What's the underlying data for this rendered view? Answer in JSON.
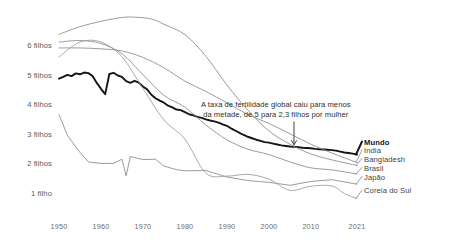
{
  "chart_data": {
    "type": "line",
    "title": "",
    "xlabel": "",
    "ylabel": "",
    "xlim": [
      1950,
      2021
    ],
    "ylim": [
      0.6,
      7.4
    ],
    "grid": false,
    "legend_position": "right-inline",
    "ytick_labels": [
      "6 filhos",
      "5 filhos",
      "4 filhos",
      "3 filhos",
      "2 filhos",
      "1 filho"
    ],
    "ytick_values": [
      6,
      5,
      4,
      3,
      2,
      1
    ],
    "xtick_labels": [
      "1950",
      "1960",
      "1970",
      "1980",
      "1990",
      "2000",
      "2010",
      "2021"
    ],
    "xtick_values": [
      1950,
      1960,
      1970,
      1980,
      1990,
      2000,
      2010,
      2021
    ],
    "annotations": [
      {
        "name": "global-fertility-note",
        "lines": [
          "A taxa de fertilidade global caiu para menos",
          "da metade, de 5 para 2,3 filhos por mulher"
        ],
        "arrow_points_to": {
          "x": 2006,
          "y": 2.6
        }
      }
    ],
    "series": [
      {
        "name": "Mundo",
        "label": "Mundo",
        "color": "#151515",
        "width": 1.9,
        "emphasis": true,
        "x": [
          1950,
          1951,
          1952,
          1953,
          1954,
          1955,
          1956,
          1957,
          1958,
          1959,
          1960,
          1961,
          1962,
          1963,
          1964,
          1965,
          1966,
          1967,
          1968,
          1969,
          1970,
          1971,
          1972,
          1973,
          1974,
          1975,
          1976,
          1977,
          1978,
          1979,
          1980,
          1981,
          1982,
          1983,
          1984,
          1985,
          1986,
          1987,
          1988,
          1989,
          1990,
          1991,
          1992,
          1993,
          1994,
          1995,
          1996,
          1997,
          1998,
          1999,
          2000,
          2001,
          2002,
          2003,
          2004,
          2005,
          2006,
          2007,
          2008,
          2009,
          2010,
          2011,
          2012,
          2013,
          2014,
          2015,
          2016,
          2017,
          2018,
          2019,
          2020,
          2021
        ],
        "y": [
          4.86,
          4.92,
          4.99,
          4.95,
          5.04,
          5.01,
          5.07,
          5.05,
          4.95,
          4.72,
          4.52,
          4.34,
          5.02,
          5.06,
          4.97,
          4.92,
          4.78,
          4.72,
          4.79,
          4.73,
          4.6,
          4.5,
          4.32,
          4.2,
          4.12,
          4.05,
          3.95,
          3.89,
          3.82,
          3.8,
          3.73,
          3.66,
          3.62,
          3.57,
          3.54,
          3.49,
          3.45,
          3.42,
          3.38,
          3.32,
          3.27,
          3.18,
          3.11,
          3.03,
          2.96,
          2.9,
          2.85,
          2.8,
          2.76,
          2.72,
          2.7,
          2.67,
          2.64,
          2.61,
          2.59,
          2.57,
          2.56,
          2.55,
          2.53,
          2.52,
          2.51,
          2.49,
          2.48,
          2.47,
          2.46,
          2.45,
          2.43,
          2.4,
          2.37,
          2.35,
          2.33,
          2.3
        ]
      },
      {
        "name": "India",
        "label": "India",
        "color": "#8a8a8a",
        "width": 0.85,
        "emphasis": false,
        "x": [
          1950,
          1955,
          1960,
          1965,
          1970,
          1975,
          1980,
          1985,
          1990,
          1995,
          2000,
          2005,
          2010,
          2015,
          2021
        ],
        "y": [
          5.9,
          5.9,
          5.87,
          5.8,
          5.58,
          5.23,
          4.78,
          4.43,
          4.05,
          3.65,
          3.35,
          3.0,
          2.65,
          2.35,
          2.03
        ]
      },
      {
        "name": "Bangladesh",
        "label": "Bangladesh",
        "color": "#8a8a8a",
        "width": 0.85,
        "emphasis": false,
        "x": [
          1950,
          1955,
          1960,
          1965,
          1968,
          1972,
          1975,
          1980,
          1985,
          1990,
          1995,
          2000,
          2005,
          2010,
          2015,
          2021
        ],
        "y": [
          6.36,
          6.62,
          6.8,
          6.93,
          6.94,
          6.88,
          6.7,
          6.35,
          5.62,
          4.65,
          3.8,
          3.1,
          2.65,
          2.32,
          2.12,
          1.93
        ]
      },
      {
        "name": "Brasil",
        "label": "Brasil",
        "color": "#8a8a8a",
        "width": 0.85,
        "emphasis": false,
        "x": [
          1950,
          1955,
          1960,
          1965,
          1970,
          1975,
          1980,
          1985,
          1990,
          1995,
          2000,
          2005,
          2010,
          2015,
          2021
        ],
        "y": [
          6.1,
          6.15,
          6.05,
          5.7,
          5.0,
          4.3,
          3.9,
          3.3,
          2.8,
          2.48,
          2.3,
          2.05,
          1.85,
          1.78,
          1.64
        ]
      },
      {
        "name": "Japão",
        "label": "Japão",
        "color": "#8a8a8a",
        "width": 0.85,
        "emphasis": false,
        "x": [
          1950,
          1952,
          1955,
          1957,
          1960,
          1963,
          1965,
          1966,
          1967,
          1970,
          1973,
          1975,
          1978,
          1980,
          1985,
          1990,
          1995,
          2000,
          2005,
          2010,
          2015,
          2021
        ],
        "y": [
          3.65,
          2.95,
          2.37,
          2.05,
          2.0,
          2.0,
          2.14,
          1.58,
          2.23,
          2.13,
          2.14,
          1.91,
          1.79,
          1.75,
          1.76,
          1.54,
          1.42,
          1.36,
          1.26,
          1.39,
          1.45,
          1.3
        ]
      },
      {
        "name": "Coreia do Sul",
        "label": "Coreia do Sul",
        "color": "#9a9a9a",
        "width": 0.85,
        "emphasis": false,
        "x": [
          1950,
          1955,
          1960,
          1965,
          1970,
          1975,
          1980,
          1985,
          1990,
          1995,
          2000,
          2005,
          2010,
          2015,
          2018,
          2021
        ],
        "y": [
          5.6,
          6.1,
          6.1,
          5.6,
          4.53,
          3.47,
          2.82,
          1.67,
          1.57,
          1.63,
          1.47,
          1.09,
          1.23,
          1.24,
          0.98,
          0.81
        ]
      }
    ]
  },
  "legend_entries": [
    {
      "label": "Mundo",
      "y_value": 2.3,
      "bold": true
    },
    {
      "label": "India",
      "y_value": 2.03,
      "bold": false
    },
    {
      "label": "Bangladesh",
      "y_value": 1.93,
      "bold": false
    },
    {
      "label": "Brasil",
      "y_value": 1.64,
      "bold": false
    },
    {
      "label": "Japão",
      "y_value": 1.3,
      "bold": false
    },
    {
      "label": "Coreia do Sul",
      "y_value": 0.81,
      "bold": false
    }
  ]
}
